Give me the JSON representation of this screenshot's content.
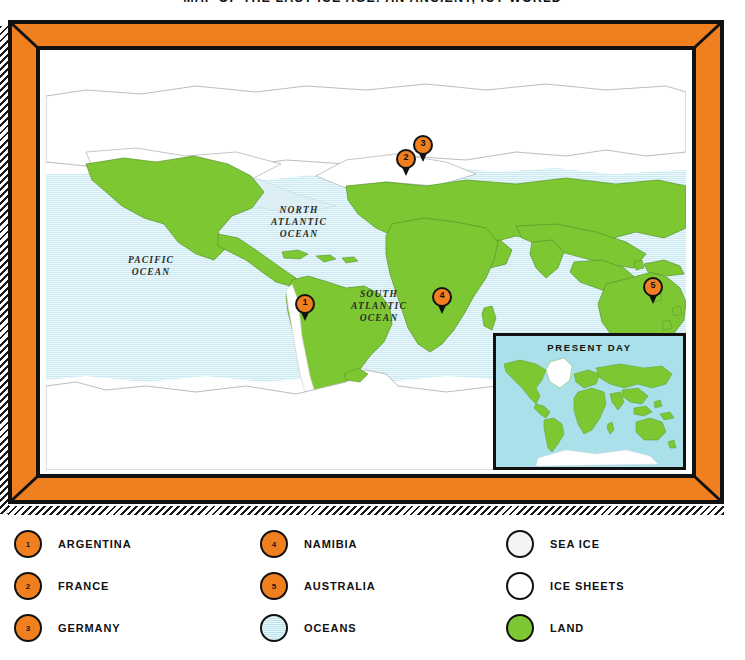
{
  "title": "MAP OF THE LAST ICE AGE: AN ANCIENT, ICY WORLD",
  "colors": {
    "frame": "#F07F20",
    "frame_outline": "#111111",
    "land": "#7DC832",
    "ocean": "#d8eff5",
    "sea_ice": "#f4f4f4",
    "ice_sheet": "#ffffff",
    "inset_ocean": "#a9e0ea",
    "pin": "#F07F20"
  },
  "map": {
    "ocean_labels": [
      {
        "name": "pacific-ocean",
        "text": "PACIFIC\nOCEAN"
      },
      {
        "name": "north-atlantic-ocean",
        "text": "NORTH\nATLANTIC\nOCEAN"
      },
      {
        "name": "south-atlantic-ocean",
        "text": "SOUTH\nATLANTIC\nOCEAN"
      }
    ],
    "pins": [
      {
        "number": "1",
        "place": "ARGENTINA",
        "x": 259,
        "y": 252
      },
      {
        "number": "2",
        "place": "FRANCE",
        "x": 360,
        "y": 107
      },
      {
        "number": "3",
        "place": "GERMANY",
        "x": 377,
        "y": 93
      },
      {
        "number": "4",
        "place": "NAMIBIA",
        "x": 396,
        "y": 245
      },
      {
        "number": "5",
        "place": "AUSTRALIA",
        "x": 607,
        "y": 235
      }
    ]
  },
  "inset": {
    "title": "PRESENT DAY"
  },
  "legend": {
    "columns": [
      [
        {
          "kind": "num",
          "num": "1",
          "label": "ARGENTINA"
        },
        {
          "kind": "num",
          "num": "2",
          "label": "FRANCE"
        },
        {
          "kind": "num",
          "num": "3",
          "label": "GERMANY"
        }
      ],
      [
        {
          "kind": "num",
          "num": "4",
          "label": "NAMIBIA"
        },
        {
          "kind": "num",
          "num": "5",
          "label": "AUSTRALIA"
        },
        {
          "kind": "ocean",
          "num": "",
          "label": "OCEANS"
        }
      ],
      [
        {
          "kind": "seaice",
          "num": "",
          "label": "SEA ICE"
        },
        {
          "kind": "icesheet",
          "num": "",
          "label": "ICE SHEETS"
        },
        {
          "kind": "land",
          "num": "",
          "label": "LAND"
        }
      ]
    ]
  }
}
